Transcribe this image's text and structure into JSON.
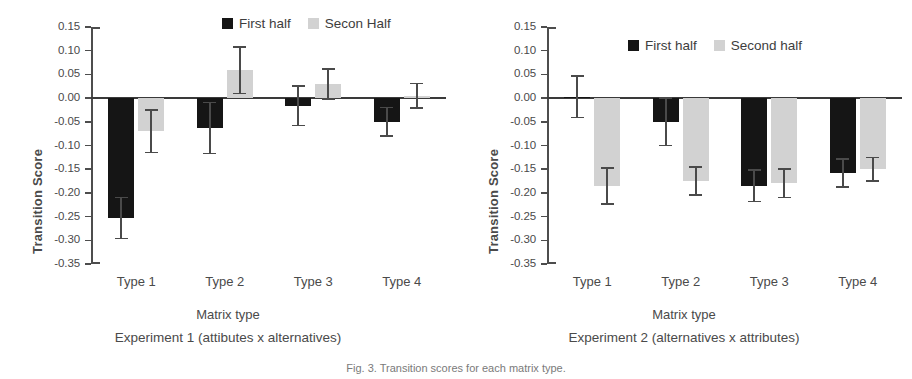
{
  "figure": {
    "caption": "Fig. 3. Transition scores for each matrix type."
  },
  "chart_data": [
    {
      "type": "bar",
      "panel_id": "experiment-1",
      "title": "",
      "subtitle": "Experiment 1 (attibutes x alternatives)",
      "xlabel": "Matrix type",
      "ylabel": "Transition Score",
      "categories": [
        "Type 1",
        "Type 2",
        "Type 3",
        "Type 4"
      ],
      "ylim": [
        -0.35,
        0.15
      ],
      "yticks": [
        "0.15",
        "0.10",
        "0.05",
        "0.00",
        "-0.05",
        "-0.10",
        "-0.15",
        "-0.20",
        "-0.25",
        "-0.30",
        "-0.35"
      ],
      "ytick_values": [
        0.15,
        0.1,
        0.05,
        0.0,
        -0.05,
        -0.1,
        -0.15,
        -0.2,
        -0.25,
        -0.3,
        -0.35
      ],
      "grid": false,
      "legend_position": "top-right",
      "series": [
        {
          "name": "First half",
          "color": "#151515",
          "values": [
            -0.253,
            -0.063,
            -0.016,
            -0.05
          ],
          "errors": [
            0.043,
            0.054,
            0.042,
            0.03
          ]
        },
        {
          "name": "Secon Half",
          "color": "#d2d2d2",
          "values": [
            -0.07,
            0.059,
            0.03,
            0.005
          ],
          "errors": [
            0.045,
            0.049,
            0.032,
            0.026
          ]
        }
      ]
    },
    {
      "type": "bar",
      "panel_id": "experiment-2",
      "title": "",
      "subtitle": "Experiment 2 (alternatives  x attributes)",
      "xlabel": "Matrix type",
      "ylabel": "Transition Score",
      "categories": [
        "Type 1",
        "Type 2",
        "Type 3",
        "Type 4"
      ],
      "ylim": [
        -0.35,
        0.15
      ],
      "yticks": [
        "0.15",
        "0.10",
        "0.05",
        "0.00",
        "-0.05",
        "-0.10",
        "-0.15",
        "-0.20",
        "-0.25",
        "-0.30",
        "-0.35"
      ],
      "ytick_values": [
        0.15,
        0.1,
        0.05,
        0.0,
        -0.05,
        -0.1,
        -0.15,
        -0.2,
        -0.25,
        -0.3,
        -0.35
      ],
      "grid": false,
      "legend_position": "top-right",
      "series": [
        {
          "name": "First half",
          "color": "#151515",
          "values": [
            0.003,
            -0.05,
            -0.185,
            -0.158
          ],
          "errors": [
            0.044,
            0.05,
            0.033,
            0.03
          ]
        },
        {
          "name": "Second half",
          "color": "#d2d2d2",
          "values": [
            -0.185,
            -0.175,
            -0.18,
            -0.15
          ],
          "errors": [
            0.038,
            0.03,
            0.03,
            0.025
          ]
        }
      ]
    }
  ]
}
